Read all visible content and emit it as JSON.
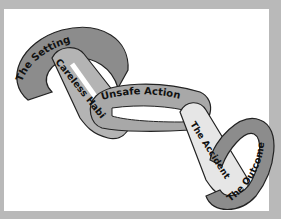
{
  "diagram": {
    "type": "chain",
    "links": [
      {
        "label": "The Setting",
        "color": "#8c8c8c"
      },
      {
        "label": "Careless Habit",
        "color": "#b4b4b4"
      },
      {
        "label": "Unsafe Action",
        "color": "#a8a8a8"
      },
      {
        "label": "The Accident",
        "color": "#e6e6e6"
      },
      {
        "label": "The Outcome",
        "color": "#8c8c8c"
      }
    ],
    "colors": {
      "background": "#b9b9b9",
      "panel": "#ffffff",
      "outline": "#222222"
    }
  }
}
